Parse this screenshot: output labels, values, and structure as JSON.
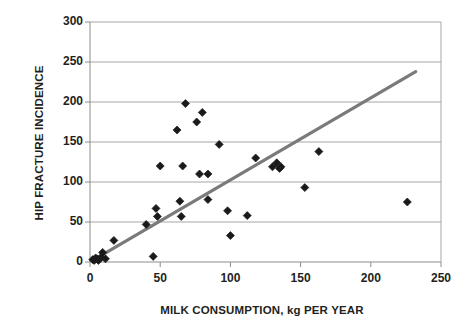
{
  "chart_data": {
    "type": "scatter",
    "title": "",
    "xlabel": "MILK CONSUMPTION, kg PER YEAR",
    "ylabel": "HIP FRACTURE INCIDENCE",
    "xlim": [
      0,
      250
    ],
    "ylim": [
      0,
      300
    ],
    "xticks": [
      0,
      50,
      100,
      150,
      200,
      250
    ],
    "yticks": [
      0,
      50,
      100,
      150,
      200,
      250,
      300
    ],
    "grid": "horizontal",
    "legend": "none",
    "marker": "diamond",
    "marker_color": "#1a1a1a",
    "trendline": {
      "color": "#7a7a7a",
      "x_start": 2,
      "y_start": 2,
      "x_end": 232,
      "y_end": 238
    },
    "points": [
      {
        "x": 2,
        "y": 3
      },
      {
        "x": 3,
        "y": 2
      },
      {
        "x": 4,
        "y": 5
      },
      {
        "x": 5,
        "y": 4
      },
      {
        "x": 6,
        "y": 2
      },
      {
        "x": 8,
        "y": 6
      },
      {
        "x": 9,
        "y": 12
      },
      {
        "x": 11,
        "y": 4
      },
      {
        "x": 17,
        "y": 27
      },
      {
        "x": 40,
        "y": 47
      },
      {
        "x": 45,
        "y": 7
      },
      {
        "x": 47,
        "y": 67
      },
      {
        "x": 48,
        "y": 57
      },
      {
        "x": 50,
        "y": 120
      },
      {
        "x": 62,
        "y": 165
      },
      {
        "x": 64,
        "y": 76
      },
      {
        "x": 65,
        "y": 57
      },
      {
        "x": 66,
        "y": 120
      },
      {
        "x": 68,
        "y": 198
      },
      {
        "x": 76,
        "y": 175
      },
      {
        "x": 78,
        "y": 110
      },
      {
        "x": 80,
        "y": 187
      },
      {
        "x": 84,
        "y": 78
      },
      {
        "x": 84,
        "y": 110
      },
      {
        "x": 92,
        "y": 147
      },
      {
        "x": 98,
        "y": 64
      },
      {
        "x": 100,
        "y": 33
      },
      {
        "x": 112,
        "y": 58
      },
      {
        "x": 118,
        "y": 130
      },
      {
        "x": 130,
        "y": 119
      },
      {
        "x": 133,
        "y": 124
      },
      {
        "x": 135,
        "y": 117
      },
      {
        "x": 136,
        "y": 119
      },
      {
        "x": 153,
        "y": 93
      },
      {
        "x": 163,
        "y": 138
      },
      {
        "x": 226,
        "y": 75
      }
    ]
  },
  "axes": {
    "x_tick_labels": [
      "0",
      "50",
      "100",
      "150",
      "200",
      "250"
    ],
    "y_tick_labels": [
      "0",
      "50",
      "100",
      "150",
      "200",
      "250",
      "300"
    ]
  }
}
